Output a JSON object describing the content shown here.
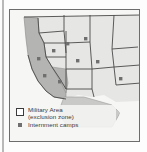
{
  "figure": {
    "kind": "map",
    "region": "Western United States",
    "colors": {
      "frame_border": "#6d6d6d",
      "land_fill": "#e6e6e4",
      "exclusion_zone_fill": "#b4b4b2",
      "state_border": "#4a4a4a",
      "ocean": "#f6f6f4",
      "camp_marker": "#6f6f6f",
      "legend_text": "#3a3a3a"
    }
  },
  "legend": {
    "items": [
      {
        "swatch": "military-area-swatch",
        "line1": "Military Area",
        "line2": "(exclusion zone)"
      },
      {
        "swatch": "internment-camp-swatch",
        "line1": "Internment camps"
      }
    ]
  },
  "map_data": {
    "exclusion_zone_label": "Military Area (exclusion zone)",
    "camp_marker_label": "Internment camps",
    "camps": [
      {
        "x": 60,
        "y": 35
      },
      {
        "x": 78,
        "y": 30
      },
      {
        "x": 46,
        "y": 42
      },
      {
        "x": 31,
        "y": 50
      },
      {
        "x": 70,
        "y": 52
      },
      {
        "x": 90,
        "y": 53
      },
      {
        "x": 37,
        "y": 67
      },
      {
        "x": 52,
        "y": 73
      },
      {
        "x": 113,
        "y": 70
      }
    ]
  }
}
